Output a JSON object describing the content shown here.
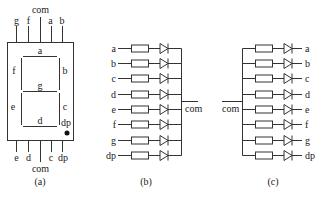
{
  "figure": {
    "panels": [
      {
        "id": "a",
        "caption": "(a)",
        "title": "Seven-segment display pinout",
        "top_pins": [
          "g",
          "f",
          "com",
          "a",
          "b"
        ],
        "bottom_pins": [
          "e",
          "d",
          "com",
          "c",
          "dp"
        ],
        "segments": {
          "a": "a",
          "b": "b",
          "c": "c",
          "d": "d",
          "e": "e",
          "f": "f",
          "g": "g",
          "dp": "dp"
        }
      },
      {
        "id": "b",
        "caption": "(b)",
        "rows": [
          "a",
          "b",
          "c",
          "d",
          "e",
          "f",
          "g",
          "dp"
        ],
        "common_label": "com",
        "common_overline": false
      },
      {
        "id": "c",
        "caption": "(c)",
        "rows": [
          "a",
          "b",
          "c",
          "d",
          "e",
          "f",
          "g",
          "dp"
        ],
        "common_label": "com",
        "common_overline": true
      }
    ]
  }
}
